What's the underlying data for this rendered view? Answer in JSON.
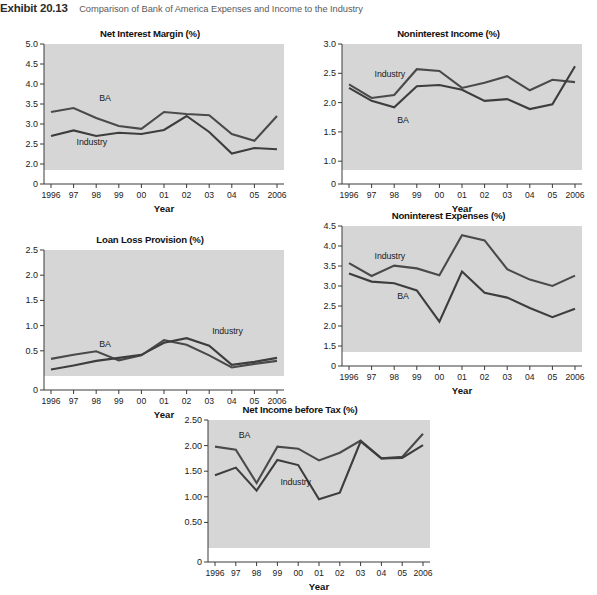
{
  "exhibit": {
    "number": "Exhibit 20.13",
    "caption": "Comparison of Bank of America Expenses and Income to the Industry"
  },
  "shared": {
    "x_axis_title": "Year",
    "categories": [
      "1996",
      "97",
      "98",
      "99",
      "00",
      "01",
      "02",
      "03",
      "04",
      "05",
      "2006"
    ],
    "series_names": {
      "ba": "BA",
      "industry": "Industry"
    },
    "line_color": "#4a4a4a",
    "plot_bg": "#d6d6d6"
  },
  "chart_data": [
    {
      "id": "net-interest-margin",
      "type": "line",
      "title": "Net Interest Margin (%)",
      "xlabel": "Year",
      "ylabel": "",
      "categories": [
        "1996",
        "97",
        "98",
        "99",
        "00",
        "01",
        "02",
        "03",
        "04",
        "05",
        "2006"
      ],
      "yticks": [
        "0",
        "2.0",
        "2.5",
        "3.0",
        "3.5",
        "4.0",
        "4.5",
        "5.0"
      ],
      "ytickvals": [
        0,
        2.0,
        2.5,
        3.0,
        3.5,
        4.0,
        4.5,
        5.0
      ],
      "ylim": [
        1.85,
        5.0
      ],
      "grid": false,
      "legend": "inline-labels",
      "series": [
        {
          "name": "BA",
          "values": [
            3.3,
            3.4,
            3.15,
            2.95,
            2.88,
            3.3,
            3.25,
            3.22,
            2.75,
            2.58,
            3.2
          ],
          "label_x": "98",
          "label_y": 3.62
        },
        {
          "name": "Industry",
          "values": [
            2.7,
            2.84,
            2.7,
            2.78,
            2.75,
            2.85,
            3.2,
            2.8,
            2.26,
            2.4,
            2.37
          ],
          "label_x": "97",
          "label_y": 2.52
        }
      ]
    },
    {
      "id": "noninterest-income",
      "type": "line",
      "title": "Noninterest Income (%)",
      "xlabel": "Year",
      "ylabel": "",
      "categories": [
        "1996",
        "97",
        "98",
        "99",
        "00",
        "01",
        "02",
        "03",
        "04",
        "05",
        "2006"
      ],
      "yticks": [
        "0",
        "1.0",
        "1.5",
        "2.0",
        "2.5",
        "3.0"
      ],
      "ytickvals": [
        0,
        1.0,
        1.5,
        2.0,
        2.5,
        3.0
      ],
      "ylim": [
        0.85,
        3.0
      ],
      "grid": false,
      "legend": "inline-labels",
      "series": [
        {
          "name": "Industry",
          "values": [
            2.31,
            2.08,
            2.13,
            2.57,
            2.54,
            2.25,
            2.34,
            2.45,
            2.21,
            2.39,
            2.35
          ],
          "label_x": "97",
          "label_y": 2.47
        },
        {
          "name": "BA",
          "values": [
            2.25,
            2.03,
            1.92,
            2.28,
            2.3,
            2.22,
            2.03,
            2.06,
            1.89,
            1.97,
            2.62
          ],
          "label_x": "98",
          "label_y": 1.68
        }
      ]
    },
    {
      "id": "loan-loss-provision",
      "type": "line",
      "title": "Loan Loss Provision (%)",
      "xlabel": "Year",
      "ylabel": "",
      "categories": [
        "1996",
        "97",
        "98",
        "99",
        "00",
        "01",
        "02",
        "03",
        "04",
        "05",
        "2006"
      ],
      "yticks": [
        "0",
        "0.5",
        "1.0",
        "1.5",
        "2.0",
        "2.5"
      ],
      "ytickvals": [
        0,
        0.5,
        1.0,
        1.5,
        2.0,
        2.5
      ],
      "ylim": [
        0,
        2.5
      ],
      "grid": false,
      "legend": "inline-labels",
      "series": [
        {
          "name": "BA",
          "values": [
            0.34,
            0.42,
            0.49,
            0.31,
            0.41,
            0.71,
            0.62,
            0.41,
            0.17,
            0.24,
            0.3
          ],
          "label_x": "98",
          "label_y": 0.62
        },
        {
          "name": "Industry",
          "values": [
            0.13,
            0.21,
            0.3,
            0.36,
            0.42,
            0.66,
            0.75,
            0.6,
            0.22,
            0.28,
            0.36
          ],
          "label_x": "03",
          "label_y": 0.88
        }
      ]
    },
    {
      "id": "noninterest-expenses",
      "type": "line",
      "title": "Noninterest Expenses (%)",
      "xlabel": "Year",
      "ylabel": "",
      "categories": [
        "1996",
        "97",
        "98",
        "99",
        "00",
        "01",
        "02",
        "03",
        "04",
        "05",
        "2006"
      ],
      "yticks": [
        "0",
        "1.5",
        "2.0",
        "2.5",
        "3.0",
        "3.5",
        "4.0",
        "4.5"
      ],
      "ytickvals": [
        0,
        1.5,
        2.0,
        2.5,
        3.0,
        3.5,
        4.0,
        4.5
      ],
      "ylim": [
        1.35,
        4.5
      ],
      "grid": false,
      "legend": "inline-labels",
      "series": [
        {
          "name": "Industry",
          "values": [
            3.57,
            3.25,
            3.51,
            3.44,
            3.27,
            4.27,
            4.14,
            3.42,
            3.16,
            3.0,
            3.26
          ],
          "label_x": "97",
          "label_y": 3.72
        },
        {
          "name": "BA",
          "values": [
            3.31,
            3.11,
            3.07,
            2.89,
            2.11,
            3.36,
            2.83,
            2.71,
            2.45,
            2.22,
            2.43
          ],
          "label_x": "98",
          "label_y": 2.72
        }
      ]
    },
    {
      "id": "net-income-before-tax",
      "type": "line",
      "title": "Net Income before Tax (%)",
      "xlabel": "Year",
      "ylabel": "",
      "categories": [
        "1996",
        "97",
        "98",
        "99",
        "00",
        "01",
        "02",
        "03",
        "04",
        "05",
        "2006"
      ],
      "yticks": [
        "0",
        "0.50",
        "1.00",
        "1.50",
        "2.00",
        "2.50"
      ],
      "ytickvals": [
        0,
        0.5,
        1.0,
        1.5,
        2.0,
        2.5
      ],
      "ylim": [
        0,
        2.5
      ],
      "grid": false,
      "legend": "inline-labels",
      "series": [
        {
          "name": "BA",
          "values": [
            1.98,
            1.92,
            1.27,
            1.98,
            1.94,
            1.71,
            1.86,
            2.1,
            1.75,
            1.78,
            2.23
          ],
          "label_x": "97",
          "label_y": 2.18
        },
        {
          "name": "Industry",
          "values": [
            1.42,
            1.57,
            1.12,
            1.72,
            1.62,
            0.95,
            1.08,
            2.08,
            1.75,
            1.76,
            2.01
          ],
          "label_x": "99",
          "label_y": 1.26
        }
      ]
    }
  ]
}
